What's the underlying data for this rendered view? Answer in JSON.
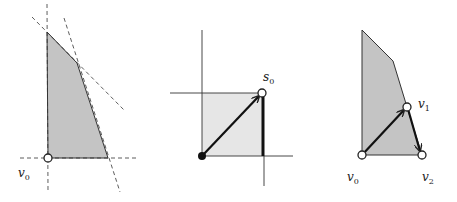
{
  "colors": {
    "region_fill_dark": "#c4c4c4",
    "region_fill_light": "#e6e6e6",
    "stroke": "#222222",
    "background": "#ffffff"
  },
  "panels": [
    {
      "name": "polygon-with-constraints",
      "labels": [
        {
          "base": "v",
          "sub": "0"
        }
      ]
    },
    {
      "name": "box-with-direction",
      "labels": [
        {
          "base": "s",
          "sub": "0"
        }
      ]
    },
    {
      "name": "polygon-path",
      "labels": [
        {
          "base": "v",
          "sub": "1"
        },
        {
          "base": "v",
          "sub": "0"
        },
        {
          "base": "v",
          "sub": "2"
        }
      ]
    }
  ]
}
